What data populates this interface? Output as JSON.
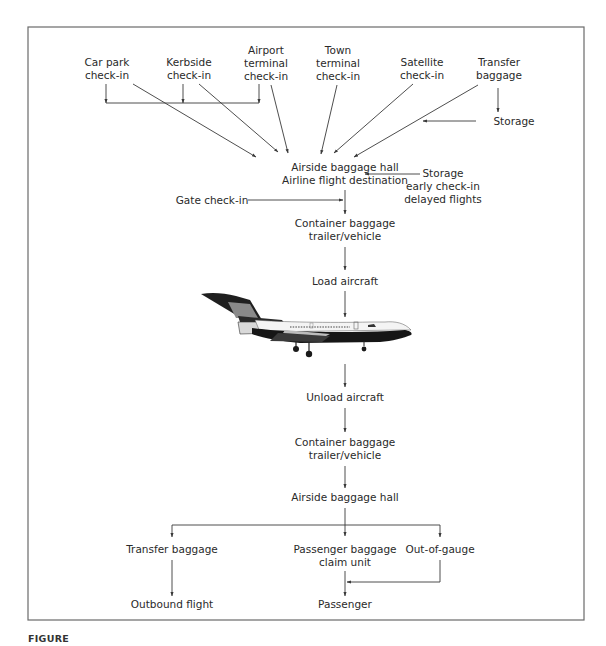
{
  "diagram": {
    "sources": {
      "car_park": [
        "Car park",
        "check-in"
      ],
      "kerbside": [
        "Kerbside",
        "check-in"
      ],
      "airport_terminal": [
        "Airport",
        "terminal",
        "check-in"
      ],
      "town_terminal": [
        "Town",
        "terminal",
        "check-in"
      ],
      "satellite": [
        "Satellite",
        "check-in"
      ],
      "transfer_baggage_in": [
        "Transfer",
        "baggage"
      ]
    },
    "storage_transfer": "Storage",
    "airside_hall_top": [
      "Airside baggage hall",
      "Airline flight destination"
    ],
    "storage_early": [
      "Storage",
      "early check-in",
      "delayed flights"
    ],
    "gate_checkin": "Gate check-in",
    "container_out": [
      "Container baggage",
      "trailer/vehicle"
    ],
    "load_aircraft": "Load aircraft",
    "aircraft_image": "aircraft-photo",
    "unload_aircraft": "Unload aircraft",
    "container_in": [
      "Container baggage",
      "trailer/vehicle"
    ],
    "airside_hall_bottom": "Airside baggage hall",
    "outputs": {
      "transfer_baggage_out": "Transfer baggage",
      "claim_unit": [
        "Passenger baggage",
        "claim unit"
      ],
      "out_of_gauge": "Out-of-gauge",
      "outbound_flight": "Outbound flight",
      "passenger": "Passenger"
    }
  },
  "caption": {
    "label": "FIGURE",
    "text": ""
  },
  "colors": {
    "line": "#3a3a3a",
    "text": "#2a2a2a",
    "frame": "#6a6a6a"
  }
}
